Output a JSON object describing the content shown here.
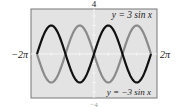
{
  "chart_data": {
    "type": "line",
    "title": "",
    "xlabel": "",
    "ylabel": "",
    "xlim": [
      -6.2832,
      6.2832
    ],
    "ylim": [
      -4,
      4
    ],
    "x_tick_labels": {
      "left": "−2π",
      "right": "2π"
    },
    "y_tick_labels": {
      "top": "4",
      "bottom": "−4"
    },
    "grid": false,
    "series": [
      {
        "name": "y = 3 sin x",
        "amplitude": 3,
        "function": "3*sin(x)",
        "color": "#111111"
      },
      {
        "name": "y = −3 sin x",
        "amplitude": -3,
        "function": "-3*sin(x)",
        "color": "#8a8a8a"
      }
    ],
    "annotations": [
      {
        "text": "y = 3 sin x",
        "series": 0,
        "position": "top-right"
      },
      {
        "text": "y = −3 sin x",
        "series": 1,
        "position": "bottom-right"
      }
    ],
    "background": "#e3e3e3",
    "frame_color": "#777777"
  }
}
